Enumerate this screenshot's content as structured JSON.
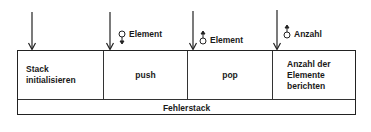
{
  "modules": [
    {
      "label_line1": "Stack",
      "label_line2": "initialisieren"
    },
    {
      "label_line1": "push"
    },
    {
      "label_line1": "pop"
    },
    {
      "label_line1": "Anzahl der",
      "label_line2": "Elemente",
      "label_line3": "berichten"
    }
  ],
  "shared_module": {
    "label": "Fehlerstack"
  },
  "data_couples": [
    {
      "label": "Element",
      "direction": "in",
      "icon": "data-couple-down-icon"
    },
    {
      "label": "Element",
      "direction": "out",
      "icon": "data-couple-up-icon"
    },
    {
      "label": "Anzahl",
      "direction": "out",
      "icon": "data-couple-up-icon"
    }
  ],
  "colors": {
    "line": "#222222",
    "background": "#ffffff"
  }
}
